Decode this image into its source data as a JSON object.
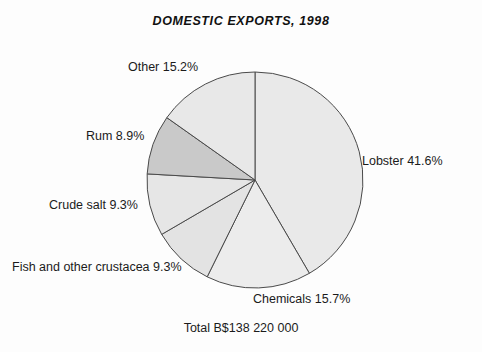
{
  "chart": {
    "title": "DOMESTIC EXPORTS, 1998",
    "total_label": "Total B$138 220 000"
  },
  "labels": {
    "lobster": "Lobster 41.6%",
    "chemicals": "Chemicals 15.7%",
    "fish": "Fish and other crustacea 9.3%",
    "crude_salt": "Crude salt 9.3%",
    "rum": "Rum 8.9%",
    "other": "Other 15.2%"
  },
  "chart_data": {
    "type": "pie",
    "title": "DOMESTIC EXPORTS, 1998",
    "subtitle": "Total B$138 220 000",
    "unit": "percent",
    "total_value": "B$138 220 000",
    "start_angle_deg": 0,
    "direction": "clockwise",
    "legend": "none",
    "labels_position": "outside",
    "categories": [
      "Lobster",
      "Chemicals",
      "Fish and other crustacea",
      "Crude salt",
      "Rum",
      "Other"
    ],
    "values": [
      41.6,
      15.7,
      9.3,
      9.3,
      8.9,
      15.2
    ],
    "slice_labels": [
      "Lobster 41.6%",
      "Chemicals 15.7%",
      "Fish and other crustacea 9.3%",
      "Crude salt 9.3%",
      "Rum 8.9%",
      "Other 15.2%"
    ],
    "colors": [
      "#e9e9e9",
      "#ececec",
      "#e3e3e3",
      "#e6e6e6",
      "#c9c9c9",
      "#e8e8e8"
    ],
    "stroke_color": "#4a4a4a",
    "center": [
      255,
      180
    ],
    "radius": 108
  }
}
